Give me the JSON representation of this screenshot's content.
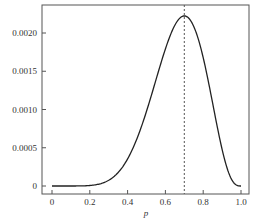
{
  "chart_data": {
    "type": "line",
    "title": "",
    "xlabel": "p",
    "ylabel": "",
    "xlim": [
      0,
      1.0
    ],
    "ylim": [
      0,
      0.0023
    ],
    "x_ticks": [
      "0",
      "0.2",
      "0.4",
      "0.6",
      "0.8",
      "1.0"
    ],
    "y_ticks": [
      "0",
      "0.0005",
      "0.0010",
      "0.0015",
      "0.0020"
    ],
    "grid": false,
    "legend": null,
    "series": [
      {
        "name": "likelihood p^7(1-p)^3",
        "x": [
          0,
          0.1,
          0.2,
          0.3,
          0.4,
          0.5,
          0.6,
          0.7,
          0.8,
          0.9,
          1.0
        ],
        "values": [
          0,
          1e-07,
          6.6e-06,
          7.52e-05,
          0.0003539,
          0.0009766,
          0.0017916,
          0.0022236,
          0.0016777,
          0.0004783,
          0
        ]
      }
    ],
    "annotations": [
      {
        "type": "vertical-dashed-line",
        "x": 0.7,
        "label": "maximum"
      }
    ]
  }
}
